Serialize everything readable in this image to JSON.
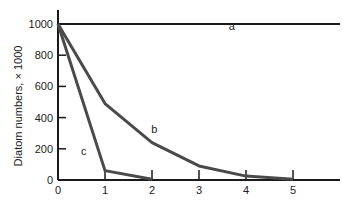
{
  "chart_data": {
    "type": "line",
    "title": "",
    "xlabel": "",
    "ylabel": "Diatom numbers, × 1000",
    "xlim": [
      0,
      6
    ],
    "ylim": [
      0,
      1000
    ],
    "x_ticks": [
      "0",
      "1",
      "2",
      "3",
      "4",
      "5"
    ],
    "y_ticks": [
      "0",
      "200",
      "400",
      "600",
      "800",
      "1000"
    ],
    "grid": false,
    "legend": "none (curves labeled inline)",
    "series": [
      {
        "name": "a",
        "x": [
          0,
          6
        ],
        "values": [
          1000,
          1000
        ],
        "color": "#1a1a1a"
      },
      {
        "name": "b",
        "x": [
          0,
          1,
          2,
          3,
          4,
          5
        ],
        "values": [
          1000,
          490,
          240,
          90,
          25,
          5
        ],
        "color": "#4a4a4a"
      },
      {
        "name": "c",
        "x": [
          0,
          1,
          2
        ],
        "values": [
          1000,
          60,
          5
        ],
        "color": "#4a4a4a"
      }
    ],
    "annotations": [
      {
        "text": "a",
        "x": 3.7,
        "y": 960
      },
      {
        "text": "b",
        "x": 2.05,
        "y": 300
      },
      {
        "text": "c",
        "x": 0.55,
        "y": 160
      }
    ]
  }
}
